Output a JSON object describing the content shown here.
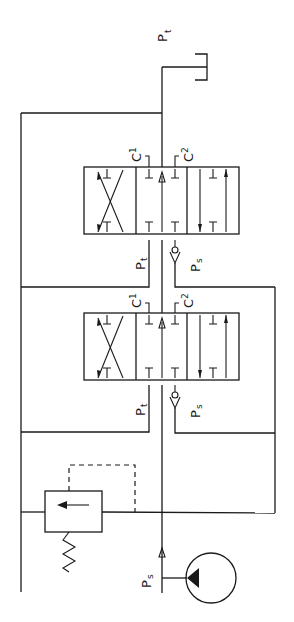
{
  "diagram": {
    "labels": {
      "tank_pressure_top": {
        "main": "P",
        "sub": "t"
      },
      "valve1_c1": {
        "main": "C",
        "sub": "1"
      },
      "valve1_c2": {
        "main": "C",
        "sub": "2"
      },
      "valve1_pt": {
        "main": "P",
        "sub": "t"
      },
      "valve1_ps": {
        "main": "P",
        "sub": "s"
      },
      "valve2_c1": {
        "main": "C",
        "sub": "1"
      },
      "valve2_c2": {
        "main": "C",
        "sub": "2"
      },
      "valve2_pt": {
        "main": "P",
        "sub": "t"
      },
      "valve2_ps": {
        "main": "P",
        "sub": "s"
      },
      "supply_ps": {
        "main": "P",
        "sub": "s"
      }
    },
    "components": [
      {
        "id": "tank",
        "type": "reservoir"
      },
      {
        "id": "valve1",
        "type": "4/3 directional valve",
        "ports": [
          "C1",
          "C2",
          "Pt",
          "Ps"
        ]
      },
      {
        "id": "valve2",
        "type": "4/3 directional valve",
        "ports": [
          "C1",
          "C2",
          "Pt",
          "Ps"
        ]
      },
      {
        "id": "check1",
        "type": "check valve"
      },
      {
        "id": "check2",
        "type": "check valve"
      },
      {
        "id": "relief",
        "type": "pressure relief valve"
      },
      {
        "id": "pump",
        "type": "fixed displacement pump"
      }
    ],
    "colors": {
      "line": "#1a1a1a",
      "background": "#ffffff"
    }
  }
}
